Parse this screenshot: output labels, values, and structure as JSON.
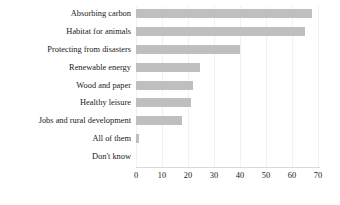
{
  "chart_data": {
    "type": "bar",
    "orientation": "horizontal",
    "title": "",
    "subtitle": "",
    "xlabel": "",
    "ylabel": "",
    "xlim": [
      0,
      70
    ],
    "xticks": [
      0,
      10,
      20,
      30,
      40,
      50,
      60,
      70
    ],
    "xtick_labels": [
      "0",
      "10",
      "20",
      "30",
      "40",
      "50",
      "60",
      "70"
    ],
    "grid": true,
    "grid_axis": "x",
    "legend": false,
    "legend_position": "none",
    "bar_color": "#bfbfbf",
    "gridline_color": "#f1f1f1",
    "axis_color": "#d8d8d8",
    "text_color": "#1a1a1a",
    "categories": [
      "Absorbing carbon",
      "Habitat for animals",
      "Protecting from disasters",
      "Renewable energy",
      "Wood and paper",
      "Healthy leisure",
      "Jobs and rural development",
      "All of them",
      "Don't know"
    ],
    "values": [
      67.5,
      65,
      40,
      24.5,
      22,
      21,
      17.5,
      1,
      0
    ]
  }
}
